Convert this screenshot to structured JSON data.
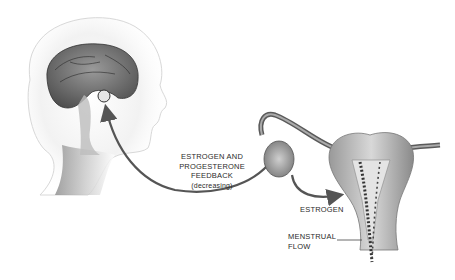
{
  "diagram": {
    "regions": {
      "head": "head-with-brain-cross-section",
      "pituitary": "pituitary-gland-highlight",
      "reproductive": "ovary-fallopian-tube-uterus"
    },
    "labels": {
      "feedback": [
        "ESTROGEN AND",
        "PROGESTERONE",
        "FEEDBACK",
        "(decreasing)"
      ],
      "estrogen": "ESTROGEN",
      "menstrual_flow": [
        "MENSTRUAL",
        "FLOW"
      ]
    },
    "arrows": [
      {
        "from": "ovary",
        "to": "pituitary",
        "label": "feedback"
      },
      {
        "from": "ovary",
        "to": "uterus",
        "label": "estrogen"
      }
    ],
    "colors": {
      "arrow": "#555555",
      "text": "#2a2a2a",
      "tissue_dark": "#6f6f6f",
      "tissue_light": "#d6d6d6"
    }
  }
}
